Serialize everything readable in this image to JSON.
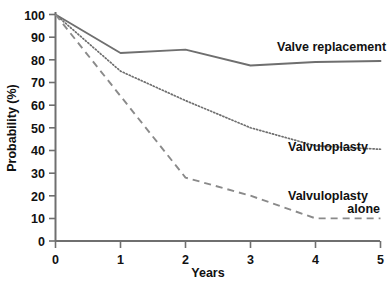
{
  "chart_data": {
    "type": "line",
    "title": "",
    "subtitle": "",
    "xlabel": "Years",
    "ylabel": "Probability (%)",
    "xlim": [
      0,
      5
    ],
    "ylim": [
      0,
      100
    ],
    "xticks": [
      "0",
      "1",
      "2",
      "3",
      "4",
      "5"
    ],
    "yticks": [
      "0",
      "10",
      "20",
      "30",
      "40",
      "50",
      "60",
      "70",
      "80",
      "90",
      "100"
    ],
    "grid": false,
    "legend_position": "inline-right-of-curve",
    "x": [
      0,
      1,
      2,
      3,
      4,
      5
    ],
    "series": [
      {
        "name": "Valve replacement",
        "style": "solid",
        "color": "#6f6f6f",
        "values": [
          100,
          83,
          84.5,
          77.5,
          79,
          79.5
        ],
        "label": "Valve replacement"
      },
      {
        "name": "Valvuloplasty",
        "style": "dotted",
        "color": "#6f6f6f",
        "values": [
          100,
          75,
          62,
          50,
          42,
          40.5
        ],
        "label": "Valvuloplasty"
      },
      {
        "name": "Valvuloplasty alone",
        "style": "dashed",
        "color": "#8a8a8a",
        "values": [
          100,
          64,
          28,
          20,
          10,
          10
        ],
        "label": "Valvuloplasty alone",
        "label_line1": "Valvuloplasty",
        "label_line2": "alone"
      }
    ]
  },
  "axes": {
    "x_title": "Years",
    "y_title": "Probability (%)",
    "x_tick_0": "0",
    "x_tick_1": "1",
    "x_tick_2": "2",
    "x_tick_3": "3",
    "x_tick_4": "4",
    "x_tick_5": "5",
    "y_tick_0": "0",
    "y_tick_10": "10",
    "y_tick_20": "20",
    "y_tick_30": "30",
    "y_tick_40": "40",
    "y_tick_50": "50",
    "y_tick_60": "60",
    "y_tick_70": "70",
    "y_tick_80": "80",
    "y_tick_90": "90",
    "y_tick_100": "100"
  },
  "labels": {
    "valve_replacement": "Valve replacement",
    "valvuloplasty": "Valvuloplasty",
    "valvuloplasty_alone_line1": "Valvuloplasty",
    "valvuloplasty_alone_line2": "alone"
  },
  "colors": {
    "axis": "#6f6f6f",
    "text": "#111111",
    "solid_series": "#6f6f6f",
    "dotted_series": "#6f6f6f",
    "dashed_series": "#8a8a8a",
    "background": "#ffffff"
  }
}
